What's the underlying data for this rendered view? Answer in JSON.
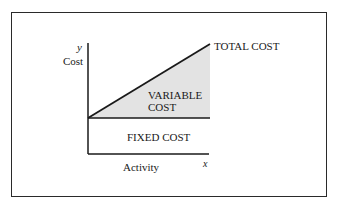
{
  "diagram": {
    "type": "cost-behavior",
    "axes": {
      "y_symbol": "y",
      "y_label": "Cost",
      "x_symbol": "x",
      "x_label": "Activity"
    },
    "regions": {
      "total_cost": "TOTAL COST",
      "variable_cost_line1": "VARIABLE",
      "variable_cost_line2": "COST",
      "fixed_cost": "FIXED COST"
    },
    "colors": {
      "variable_fill": "#e3e3e3",
      "line": "#1a1a1a",
      "border": "#2a2a2a"
    }
  }
}
